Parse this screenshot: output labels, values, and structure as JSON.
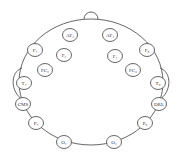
{
  "diagram": {
    "title": "",
    "type": "EEG electrode placement (head top view)",
    "electrodes": [
      {
        "id": "AF3",
        "label": "AF₃",
        "x": 70,
        "y": 35
      },
      {
        "id": "AF4",
        "label": "AF₄",
        "x": 110,
        "y": 35
      },
      {
        "id": "F7",
        "label": "F₇",
        "x": 35,
        "y": 50
      },
      {
        "id": "F3",
        "label": "F₃",
        "x": 64,
        "y": 55
      },
      {
        "id": "F4",
        "label": "F₄",
        "x": 115,
        "y": 56
      },
      {
        "id": "F8",
        "label": "F₈",
        "x": 147,
        "y": 50
      },
      {
        "id": "FC5",
        "label": "FC₅",
        "x": 45,
        "y": 70
      },
      {
        "id": "FC6",
        "label": "FC₆",
        "x": 133,
        "y": 70
      },
      {
        "id": "T7",
        "label": "T₇",
        "x": 24,
        "y": 83
      },
      {
        "id": "T8",
        "label": "T₈",
        "x": 158,
        "y": 83
      },
      {
        "id": "CMS",
        "label": "CMS",
        "x": 23,
        "y": 104
      },
      {
        "id": "DRL",
        "label": "DRL",
        "x": 159,
        "y": 104
      },
      {
        "id": "P7",
        "label": "P₇",
        "x": 36,
        "y": 123
      },
      {
        "id": "P8",
        "label": "P₈",
        "x": 145,
        "y": 123
      },
      {
        "id": "O1",
        "label": "O₁",
        "x": 64,
        "y": 142
      },
      {
        "id": "O2",
        "label": "O₂",
        "x": 114,
        "y": 142
      }
    ],
    "colors": {
      "stroke": "#555555",
      "background": "#ffffff",
      "text": "#333333"
    }
  }
}
